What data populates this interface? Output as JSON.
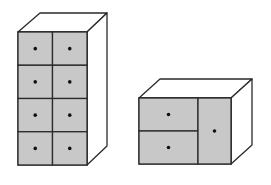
{
  "figure": {
    "colors": {
      "outline": "#2a2a2a",
      "front_fill": "#c8c8c8",
      "side_fill": "#ffffff",
      "top_fill": "#ffffff",
      "knob": "#111111",
      "background": "#ffffff"
    },
    "cabinets": [
      {
        "name": "tall-cabinet",
        "drawer_rows": 4,
        "drawer_cols": 2,
        "drawer_count": 8
      },
      {
        "name": "short-cabinet",
        "drawers_left": 2,
        "doors_right": 1,
        "compartment_count": 3
      }
    ]
  }
}
